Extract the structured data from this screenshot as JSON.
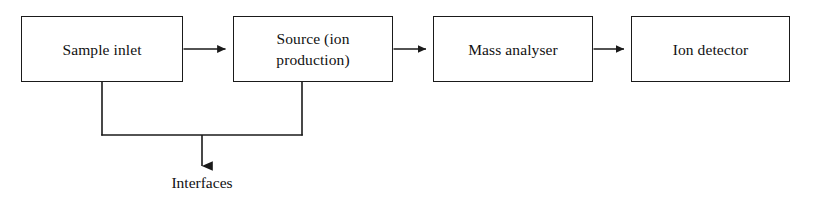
{
  "diagram": {
    "background_color": "#ffffff",
    "line_color": "#1a1a1a",
    "text_color": "#111111",
    "nodes": [
      {
        "id": "sample-inlet",
        "label": "Sample inlet"
      },
      {
        "id": "source",
        "label": "Source (ion\nproduction)"
      },
      {
        "id": "mass-analyser",
        "label": "Mass analyser"
      },
      {
        "id": "ion-detector",
        "label": "Ion detector"
      }
    ],
    "free_labels": [
      {
        "id": "interfaces",
        "label": "Interfaces"
      }
    ],
    "connectors": [
      {
        "id": "sample-inlet-to-source",
        "from": "sample-inlet",
        "to": "source",
        "kind": "arrow-right"
      },
      {
        "id": "source-to-mass-analyser",
        "from": "source",
        "to": "mass-analyser",
        "kind": "arrow-right"
      },
      {
        "id": "mass-analyser-to-ion-detector",
        "from": "mass-analyser",
        "to": "ion-detector",
        "kind": "arrow-right"
      },
      {
        "id": "sample-inlet-drop",
        "from": "sample-inlet",
        "to": "merge-bar",
        "kind": "line-down"
      },
      {
        "id": "source-drop",
        "from": "source",
        "to": "merge-bar",
        "kind": "line-down"
      },
      {
        "id": "merge-bar",
        "from": "merge-bar",
        "to": "merge-bar",
        "kind": "line-horizontal"
      },
      {
        "id": "merge-to-interfaces",
        "from": "merge-bar",
        "to": "interfaces",
        "kind": "arrow-down"
      }
    ]
  }
}
